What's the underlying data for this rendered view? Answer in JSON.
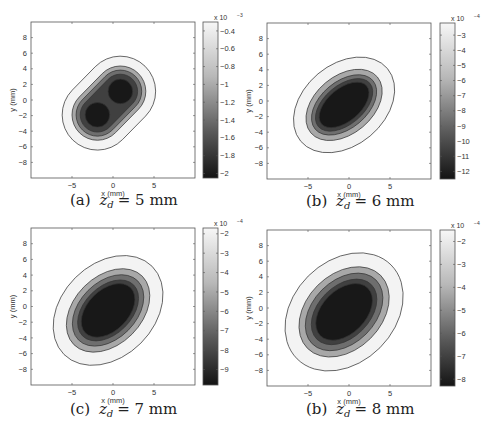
{
  "chart_data": [
    {
      "type": "contour",
      "panel_label": "(a)",
      "caption_var": "z",
      "caption_sub": "d",
      "caption_value": "= 5 mm",
      "xlabel": "x (mm)",
      "ylabel": "y (mm)",
      "xlim": [
        -10,
        10
      ],
      "ylim": [
        -10,
        10
      ],
      "xticks": [
        -5,
        0,
        5
      ],
      "yticks": [
        8,
        6,
        4,
        2,
        0,
        -2,
        -4,
        -6,
        -8
      ],
      "colorbar": {
        "multiplier": "x 10",
        "exponent": "-3",
        "ticks": [
          "-0.4",
          "-0.6",
          "-0.8",
          "-1",
          "-1.2",
          "-1.4",
          "-1.6",
          "-1.8",
          "-2"
        ],
        "range": [
          -2.05,
          -0.3
        ]
      },
      "shape": "double-lobe",
      "lobes": [
        {
          "x": -1.9,
          "y": -1.9
        },
        {
          "x": 0.9,
          "y": 1.1
        }
      ],
      "levels": [
        {
          "r": 4.3,
          "fill": "#f3f3f3"
        },
        {
          "r": 3.1,
          "fill": "#a8a8a8"
        },
        {
          "r": 2.6,
          "fill": "#6e6e6e"
        },
        {
          "r": 2.1,
          "fill": "#404040"
        },
        {
          "r": 1.5,
          "fill": "#181818"
        }
      ]
    },
    {
      "type": "contour",
      "panel_label": "(b)",
      "caption_var": "z",
      "caption_sub": "d",
      "caption_value": "= 6 mm",
      "xlabel": "x (mm)",
      "ylabel": "y (mm)",
      "xlim": [
        -10,
        10
      ],
      "ylim": [
        -10,
        10
      ],
      "xticks": [
        -5,
        0,
        5
      ],
      "yticks": [
        8,
        6,
        4,
        2,
        0,
        -2,
        -4,
        -6,
        -8
      ],
      "colorbar": {
        "multiplier": "x 10",
        "exponent": "-4",
        "ticks": [
          "-3",
          "-4",
          "-5",
          "-6",
          "-7",
          "-8",
          "-9",
          "-10",
          "-11",
          "-12"
        ],
        "range": [
          -12.5,
          -2.2
        ]
      },
      "shape": "ellipse",
      "center": {
        "x": -0.6,
        "y": -0.5
      },
      "angle_deg": 40,
      "levels": [
        {
          "a": 6.9,
          "b": 5.2,
          "fill": "#f3f3f3"
        },
        {
          "a": 5.3,
          "b": 3.7,
          "fill": "#a8a8a8"
        },
        {
          "a": 4.6,
          "b": 3.0,
          "fill": "#6e6e6e"
        },
        {
          "a": 4.1,
          "b": 2.5,
          "fill": "#404040"
        },
        {
          "a": 3.6,
          "b": 2.1,
          "fill": "#181818"
        }
      ]
    },
    {
      "type": "contour",
      "panel_label": "(c)",
      "caption_var": "z",
      "caption_sub": "d",
      "caption_value": "= 7 mm",
      "xlabel": "x (mm)",
      "ylabel": "y (mm)",
      "xlim": [
        -10,
        10
      ],
      "ylim": [
        -10,
        10
      ],
      "xticks": [
        -5,
        0,
        5
      ],
      "yticks": [
        8,
        6,
        4,
        2,
        0,
        -2,
        -4,
        -6,
        -8
      ],
      "colorbar": {
        "multiplier": "x 10",
        "exponent": "-4",
        "ticks": [
          "-2",
          "-3",
          "-4",
          "-5",
          "-6",
          "-7",
          "-8",
          "-9"
        ],
        "range": [
          -9.8,
          -1.7
        ]
      },
      "shape": "ellipse",
      "center": {
        "x": -0.6,
        "y": -0.5
      },
      "angle_deg": 45,
      "levels": [
        {
          "a": 7.6,
          "b": 5.9,
          "fill": "#f3f3f3"
        },
        {
          "a": 5.9,
          "b": 4.3,
          "fill": "#a8a8a8"
        },
        {
          "a": 5.1,
          "b": 3.6,
          "fill": "#6e6e6e"
        },
        {
          "a": 4.4,
          "b": 3.0,
          "fill": "#404040"
        },
        {
          "a": 3.9,
          "b": 2.6,
          "fill": "#181818"
        }
      ]
    },
    {
      "type": "contour",
      "panel_label": "(b)",
      "caption_var": "z",
      "caption_sub": "d",
      "caption_value": "= 8 mm",
      "xlabel": "x (mm)",
      "ylabel": "y (mm)",
      "xlim": [
        -10,
        10
      ],
      "ylim": [
        -10,
        10
      ],
      "xticks": [
        -5,
        0,
        5
      ],
      "yticks": [
        8,
        6,
        4,
        2,
        0,
        -2,
        -4,
        -6,
        -8
      ],
      "colorbar": {
        "multiplier": "x 10",
        "exponent": "-4",
        "ticks": [
          "-2",
          "-3",
          "-4",
          "-5",
          "-6",
          "-7",
          "-8"
        ],
        "range": [
          -8.3,
          -1.5
        ]
      },
      "shape": "ellipse",
      "center": {
        "x": -0.6,
        "y": -0.5
      },
      "angle_deg": 45,
      "levels": [
        {
          "a": 8.1,
          "b": 6.5,
          "fill": "#f3f3f3"
        },
        {
          "a": 6.3,
          "b": 4.8,
          "fill": "#a8a8a8"
        },
        {
          "a": 5.5,
          "b": 4.0,
          "fill": "#6e6e6e"
        },
        {
          "a": 4.7,
          "b": 3.3,
          "fill": "#404040"
        },
        {
          "a": 4.1,
          "b": 2.8,
          "fill": "#181818"
        }
      ]
    }
  ],
  "layout": {
    "panels": [
      {
        "frame": [
          31,
          22,
          164,
          156
        ],
        "cbar": [
          203,
          22,
          15,
          156
        ],
        "caption_y": 205,
        "caption_x": 70
      },
      {
        "frame": [
          267,
          23,
          164,
          156
        ],
        "cbar": [
          440,
          23,
          15,
          156
        ],
        "caption_y": 206,
        "caption_x": 306
      },
      {
        "frame": [
          31,
          228,
          164,
          157
        ],
        "cbar": [
          203,
          228,
          15,
          157
        ],
        "caption_y": 414,
        "caption_x": 70
      },
      {
        "frame": [
          267,
          230,
          164,
          156
        ],
        "cbar": [
          440,
          230,
          15,
          156
        ],
        "caption_y": 414,
        "caption_x": 306
      }
    ]
  }
}
